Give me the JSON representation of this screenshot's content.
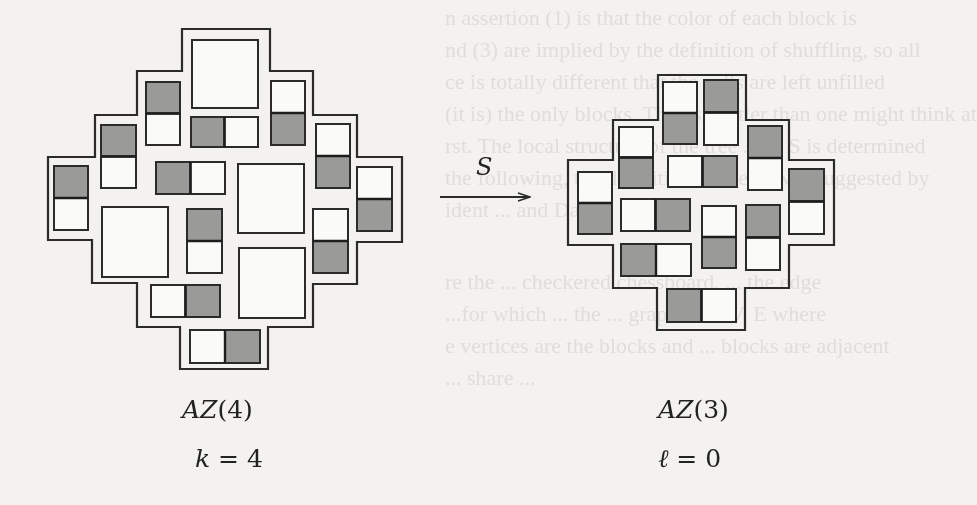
{
  "figure": {
    "left": {
      "title": "AZ(4)",
      "title_name": "AZ",
      "title_arg": "(4)",
      "parameter": "k = 4",
      "param_var": "k",
      "param_eq": " = 4",
      "outline_points": "182,29 270,29 270,71 313,71 313,115 357,115 357,157 402,157 402,242 357,242 357,284 313,284 313,327 268,327 268,369 180,369 180,327 137,327 137,283 92,283 92,240 48,240 48,157 95,157 95,115 137,115 137,71 182,71 182,29",
      "big_squares": [
        {
          "x": 192,
          "y": 40,
          "w": 66,
          "h": 68
        },
        {
          "x": 238,
          "y": 164,
          "w": 66,
          "h": 69
        },
        {
          "x": 102,
          "y": 207,
          "w": 66,
          "h": 70
        },
        {
          "x": 239,
          "y": 248,
          "w": 66,
          "h": 70
        }
      ],
      "dominoes": [
        {
          "orient": "v",
          "x": 146,
          "y": 82,
          "w": 34,
          "h": 63,
          "shaded": "first"
        },
        {
          "orient": "h",
          "x": 191,
          "y": 117,
          "w": 67,
          "h": 30,
          "shaded": "first"
        },
        {
          "orient": "v",
          "x": 271,
          "y": 81,
          "w": 34,
          "h": 64,
          "shaded": "second"
        },
        {
          "orient": "v",
          "x": 101,
          "y": 125,
          "w": 35,
          "h": 63,
          "shaded": "first"
        },
        {
          "orient": "h",
          "x": 156,
          "y": 162,
          "w": 69,
          "h": 32,
          "shaded": "first"
        },
        {
          "orient": "v",
          "x": 316,
          "y": 124,
          "w": 34,
          "h": 64,
          "shaded": "second"
        },
        {
          "orient": "v",
          "x": 54,
          "y": 166,
          "w": 34,
          "h": 64,
          "shaded": "first"
        },
        {
          "orient": "v",
          "x": 357,
          "y": 167,
          "w": 35,
          "h": 64,
          "shaded": "second"
        },
        {
          "orient": "v",
          "x": 187,
          "y": 209,
          "w": 35,
          "h": 64,
          "shaded": "first"
        },
        {
          "orient": "v",
          "x": 313,
          "y": 209,
          "w": 35,
          "h": 64,
          "shaded": "second"
        },
        {
          "orient": "h",
          "x": 151,
          "y": 285,
          "w": 69,
          "h": 32,
          "shaded": "second"
        },
        {
          "orient": "h",
          "x": 190,
          "y": 330,
          "w": 70,
          "h": 33,
          "shaded": "second"
        }
      ]
    },
    "arrow": {
      "label": "S",
      "x1": 440,
      "y1": 197,
      "x2": 530,
      "y2": 197
    },
    "right": {
      "title": "AZ(3)",
      "title_name": "AZ",
      "title_arg": "(3)",
      "parameter": "ℓ = 0",
      "param_var": "ℓ",
      "param_eq": " = 0",
      "outline_points": "658,75 746,75 746,120 789,120 789,160 834,160 834,245 789,245 789,288 745,288 745,330 657,330 657,288 613,288 613,245 568,245 568,160 613,160 613,120 658,120 658,75",
      "big_squares": [],
      "dominoes": [
        {
          "orient": "v",
          "x": 663,
          "y": 82,
          "w": 34,
          "h": 62,
          "shaded": "second"
        },
        {
          "orient": "v",
          "x": 704,
          "y": 80,
          "w": 34,
          "h": 65,
          "shaded": "first"
        },
        {
          "orient": "v",
          "x": 619,
          "y": 127,
          "w": 34,
          "h": 61,
          "shaded": "second"
        },
        {
          "orient": "h",
          "x": 668,
          "y": 156,
          "w": 69,
          "h": 31,
          "shaded": "second"
        },
        {
          "orient": "v",
          "x": 748,
          "y": 126,
          "w": 34,
          "h": 64,
          "shaded": "first"
        },
        {
          "orient": "v",
          "x": 578,
          "y": 172,
          "w": 34,
          "h": 62,
          "shaded": "second"
        },
        {
          "orient": "h",
          "x": 621,
          "y": 199,
          "w": 69,
          "h": 32,
          "shaded": "second"
        },
        {
          "orient": "v",
          "x": 702,
          "y": 206,
          "w": 34,
          "h": 62,
          "shaded": "second"
        },
        {
          "orient": "v",
          "x": 746,
          "y": 205,
          "w": 34,
          "h": 65,
          "shaded": "first"
        },
        {
          "orient": "v",
          "x": 789,
          "y": 169,
          "w": 35,
          "h": 65,
          "shaded": "first"
        },
        {
          "orient": "h",
          "x": 621,
          "y": 244,
          "w": 70,
          "h": 32,
          "shaded": "first"
        },
        {
          "orient": "h",
          "x": 667,
          "y": 289,
          "w": 69,
          "h": 33,
          "shaded": "first"
        }
      ]
    },
    "colors": {
      "background": "#f3f2ef",
      "line": "#2b2b2b",
      "shaded": "#9a9a98",
      "white": "#fafaf8",
      "bleed_text": "#cfcdc8"
    }
  },
  "bleed_through": [
    "n assertion (1) is that the color of each block is",
    "nd (3) are implied by the definition of shuffling, so all",
    "ce is totally different that the cells are left unfilled",
    "(it is) the only blocks. This is subtler than one might think at",
    "rst. The local structure of the tree ... of S is determined",
    "the following, the definition of the ... was suggested by",
    "ident ... and Daniel ...",
    "",
    "re the ... checkered chessboard, ... the edge",
    "...for which ... the ... graph ... of V, E where",
    "e vertices are the blocks and ... blocks are adjacent",
    "... share ..."
  ]
}
